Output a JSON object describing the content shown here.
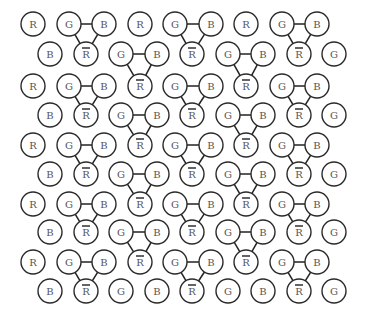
{
  "diagram": {
    "title": "",
    "node_radius": 12,
    "colors": {
      "stroke": "#2a2a2a",
      "label": "#555555",
      "background": "#ffffff"
    },
    "columns_odd": [
      33,
      69,
      104,
      140,
      175,
      211,
      246,
      282,
      317
    ],
    "columns_even": [
      50,
      86,
      121,
      157,
      192,
      228,
      263,
      299,
      334
    ],
    "rows": [
      {
        "y": 24,
        "parity": "odd",
        "labels": [
          "R",
          "G",
          "B",
          "R",
          "G",
          "B",
          "R",
          "G",
          "B"
        ]
      },
      {
        "y": 54,
        "parity": "even",
        "labels": [
          "B",
          "R̄",
          "G",
          "B",
          "R̄",
          "G",
          "B",
          "R̄",
          "G"
        ]
      },
      {
        "y": 86,
        "parity": "odd",
        "labels": [
          "R",
          "G",
          "B",
          "R̄",
          "G",
          "B",
          "R̄",
          "G",
          "B"
        ]
      },
      {
        "y": 115,
        "parity": "even",
        "labels": [
          "B",
          "R̄",
          "G",
          "B",
          "R̄",
          "G",
          "B",
          "R̄",
          "G"
        ]
      },
      {
        "y": 145,
        "parity": "odd",
        "labels": [
          "R",
          "G",
          "B",
          "R̄",
          "G",
          "B",
          "R̄",
          "G",
          "B"
        ]
      },
      {
        "y": 174,
        "parity": "even",
        "labels": [
          "B",
          "R̄",
          "G",
          "B",
          "R̄",
          "G",
          "B",
          "R̄",
          "G"
        ]
      },
      {
        "y": 204,
        "parity": "odd",
        "labels": [
          "R",
          "G",
          "B",
          "R̄",
          "G",
          "B",
          "R̄",
          "G",
          "B"
        ]
      },
      {
        "y": 232,
        "parity": "even",
        "labels": [
          "B",
          "R̄",
          "G",
          "B",
          "R̄",
          "G",
          "B",
          "R̄",
          "G"
        ]
      },
      {
        "y": 262,
        "parity": "odd",
        "labels": [
          "R",
          "G",
          "B",
          "R̄",
          "G",
          "B",
          "R̄",
          "G",
          "B"
        ]
      },
      {
        "y": 291,
        "parity": "even",
        "labels": [
          "B",
          "R̄",
          "G",
          "B",
          "R̄",
          "G",
          "B",
          "R̄",
          "G"
        ]
      }
    ],
    "triangles": [
      {
        "g": [
          0,
          1
        ],
        "b": [
          0,
          2
        ],
        "r": [
          1,
          1
        ]
      },
      {
        "g": [
          0,
          4
        ],
        "b": [
          0,
          5
        ],
        "r": [
          1,
          4
        ]
      },
      {
        "g": [
          0,
          7
        ],
        "b": [
          0,
          8
        ],
        "r": [
          1,
          7
        ]
      },
      {
        "g": [
          1,
          2
        ],
        "b": [
          1,
          3
        ],
        "r": [
          2,
          3
        ]
      },
      {
        "g": [
          1,
          5
        ],
        "b": [
          1,
          6
        ],
        "r": [
          2,
          6
        ]
      },
      {
        "g": [
          2,
          1
        ],
        "b": [
          2,
          2
        ],
        "r": [
          3,
          1
        ]
      },
      {
        "g": [
          2,
          4
        ],
        "b": [
          2,
          5
        ],
        "r": [
          3,
          4
        ]
      },
      {
        "g": [
          2,
          7
        ],
        "b": [
          2,
          8
        ],
        "r": [
          3,
          7
        ]
      },
      {
        "g": [
          3,
          2
        ],
        "b": [
          3,
          3
        ],
        "r": [
          4,
          3
        ]
      },
      {
        "g": [
          3,
          5
        ],
        "b": [
          3,
          6
        ],
        "r": [
          4,
          6
        ]
      },
      {
        "g": [
          4,
          1
        ],
        "b": [
          4,
          2
        ],
        "r": [
          5,
          1
        ]
      },
      {
        "g": [
          4,
          4
        ],
        "b": [
          4,
          5
        ],
        "r": [
          5,
          4
        ]
      },
      {
        "g": [
          4,
          7
        ],
        "b": [
          4,
          8
        ],
        "r": [
          5,
          7
        ]
      },
      {
        "g": [
          5,
          2
        ],
        "b": [
          5,
          3
        ],
        "r": [
          6,
          3
        ]
      },
      {
        "g": [
          5,
          5
        ],
        "b": [
          5,
          6
        ],
        "r": [
          6,
          6
        ]
      },
      {
        "g": [
          6,
          1
        ],
        "b": [
          6,
          2
        ],
        "r": [
          7,
          1
        ]
      },
      {
        "g": [
          6,
          4
        ],
        "b": [
          6,
          5
        ],
        "r": [
          7,
          4
        ]
      },
      {
        "g": [
          6,
          7
        ],
        "b": [
          6,
          8
        ],
        "r": [
          7,
          7
        ]
      },
      {
        "g": [
          7,
          2
        ],
        "b": [
          7,
          3
        ],
        "r": [
          8,
          3
        ]
      },
      {
        "g": [
          7,
          5
        ],
        "b": [
          7,
          6
        ],
        "r": [
          8,
          6
        ]
      },
      {
        "g": [
          8,
          1
        ],
        "b": [
          8,
          2
        ],
        "r": [
          9,
          1
        ]
      },
      {
        "g": [
          8,
          4
        ],
        "b": [
          8,
          5
        ],
        "r": [
          9,
          4
        ]
      },
      {
        "g": [
          8,
          7
        ],
        "b": [
          8,
          8
        ],
        "r": [
          9,
          7
        ]
      }
    ]
  }
}
